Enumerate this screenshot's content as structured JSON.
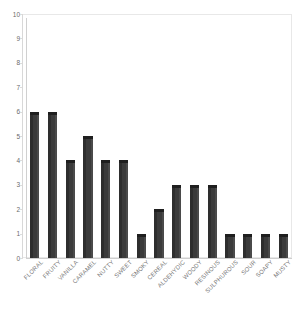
{
  "chart_data": {
    "type": "bar",
    "title": "",
    "xlabel": "",
    "ylabel": "",
    "ylim": [
      0,
      10
    ],
    "yticks": [
      0,
      1,
      2,
      3,
      4,
      5,
      6,
      7,
      8,
      9,
      10
    ],
    "grid": false,
    "legend": null,
    "bar_color": "#3b3b3b",
    "categories": [
      "FLORAL",
      "FRUITY",
      "VANILLA",
      "CARAMEL",
      "NUTTY",
      "SWEET",
      "SMOKY",
      "CEREAL",
      "ALDEHYDIC",
      "WOODY",
      "RESINOUS",
      "SULPHUROUS",
      "SOUR",
      "SOAPY",
      "MUSTY"
    ],
    "values": [
      6,
      6,
      4,
      5,
      4,
      4,
      1,
      2,
      3,
      3,
      3,
      1,
      1,
      1,
      1
    ]
  },
  "colors": {
    "bar": "#3b3b3b",
    "bar_shadow": "#2e2e2e",
    "bar_top": "#1f1f1f",
    "frame": "#e8e8e8",
    "axis": "#cfcfcf",
    "tick_text": "#6a6a6a",
    "label_text": "#777777",
    "background": "#ffffff"
  }
}
